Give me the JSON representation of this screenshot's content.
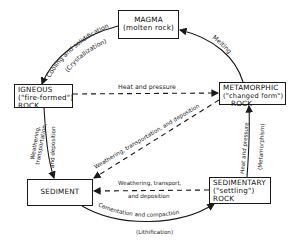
{
  "diagram": {
    "nodes": {
      "magma": {
        "line1": "MAGMA",
        "line2": "(molten rock)"
      },
      "igneous": {
        "line1": "IGNEOUS",
        "line2": "(\"fire-formed\")",
        "line3": "ROCK"
      },
      "metamorphic": {
        "line1": "METAMORPHIC",
        "line2": "(\"changed form\")",
        "line3": "ROCK"
      },
      "sedimentary": {
        "line1": "SEDIMENTARY",
        "line2": "(\"settling\")",
        "line3": "ROCK"
      },
      "sediment": {
        "line1": "SEDIMENT"
      }
    },
    "edges": {
      "magma_to_igneous": {
        "line1": "Cooling and solidification",
        "line2": "(Crystallization)"
      },
      "metamorphic_to_magma": {
        "line1": "Melting"
      },
      "igneous_to_metamorphic": {
        "line1": "Heat and pressure"
      },
      "igneous_to_sediment": {
        "line1": "Weathering,",
        "line2": "transportation,",
        "line3": "and deposition"
      },
      "metamorphic_to_sediment": {
        "line1": "Weathering, transportation, and deposition"
      },
      "sedimentary_to_sediment": {
        "line1": "Weathering, transport,",
        "line2": "and deposition"
      },
      "sediment_to_sedimentary": {
        "line1": "Cementation and compaction",
        "line2": "(Lithification)"
      },
      "sedimentary_to_metamorphic": {
        "line1": "Heat and pressure",
        "line2": "(Metamorphism)"
      }
    }
  }
}
